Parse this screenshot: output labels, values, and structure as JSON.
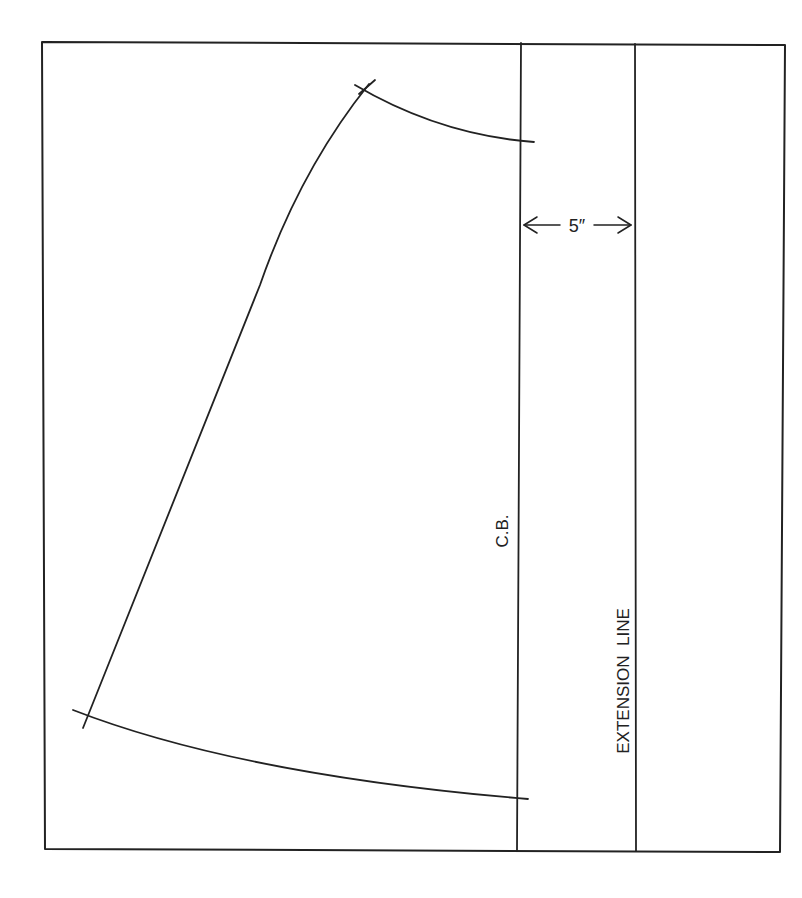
{
  "diagram": {
    "type": "pattern-drafting",
    "colors": {
      "ink": "#222222",
      "paper": "#ffffff"
    },
    "labels": {
      "center_back": "C.B.",
      "extension_line": "EXTENSION  LINE",
      "measurement": "5″"
    },
    "measurement": {
      "value": 5,
      "unit": "inch",
      "between": [
        "C.B.",
        "EXTENSION LINE"
      ]
    }
  }
}
